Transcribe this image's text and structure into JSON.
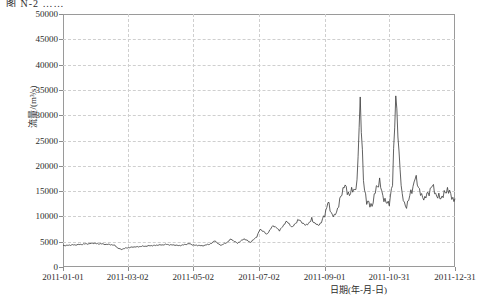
{
  "figure": {
    "caption": "图 N-2 ……",
    "axis_color": "#9a9a9a",
    "grid_color": "#cfcfcf",
    "line_color": "#3a3a3a"
  },
  "chart_data": {
    "type": "line",
    "title": "",
    "xlabel": "日期(年-月-日)",
    "ylabel": "流量/(m³/s)",
    "ylim": [
      0,
      50000
    ],
    "ytick_labels": [
      "0",
      "5000",
      "10000",
      "15000",
      "20000",
      "25000",
      "30000",
      "35000",
      "40000",
      "45000",
      "50000"
    ],
    "ytick_values": [
      0,
      5000,
      10000,
      15000,
      20000,
      25000,
      30000,
      35000,
      40000,
      45000,
      50000
    ],
    "xtick_labels": [
      "2011-01-01",
      "2011-03-02",
      "2011-05-02",
      "2011-07-02",
      "2011-09-01",
      "2011-10-31",
      "2011-12-31"
    ],
    "xtick_days": [
      0,
      60,
      121,
      182,
      243,
      303,
      364
    ],
    "xlim_days": [
      0,
      364
    ],
    "grid": true,
    "legend": null,
    "series": [
      {
        "name": "流量",
        "units": "m³/s",
        "x_days": [
          0,
          3,
          6,
          9,
          12,
          15,
          18,
          21,
          24,
          27,
          30,
          33,
          36,
          39,
          42,
          45,
          48,
          51,
          54,
          57,
          60,
          63,
          66,
          69,
          72,
          75,
          78,
          81,
          84,
          87,
          90,
          93,
          96,
          99,
          102,
          105,
          108,
          111,
          114,
          117,
          120,
          123,
          126,
          129,
          132,
          135,
          138,
          141,
          144,
          147,
          150,
          153,
          156,
          159,
          162,
          165,
          168,
          171,
          174,
          177,
          180,
          183,
          186,
          189,
          192,
          195,
          198,
          201,
          204,
          207,
          210,
          213,
          216,
          219,
          222,
          225,
          228,
          231,
          234,
          237,
          240,
          243,
          246,
          249,
          252,
          255,
          258,
          261,
          264,
          267,
          270,
          273,
          276,
          279,
          282,
          285,
          288,
          291,
          294,
          297,
          300,
          303,
          306,
          309,
          312,
          315,
          318,
          321,
          324,
          327,
          330,
          333,
          336,
          339,
          342,
          345,
          348,
          351,
          354,
          357,
          360,
          364
        ],
        "values": [
          4300,
          4250,
          4300,
          4400,
          4350,
          4450,
          4500,
          4550,
          4600,
          4700,
          4650,
          4600,
          4550,
          4500,
          4450,
          4400,
          4300,
          3700,
          3500,
          3650,
          3800,
          3900,
          3950,
          4000,
          4050,
          4100,
          4150,
          4200,
          4250,
          4300,
          4350,
          4400,
          4450,
          4400,
          4350,
          4300,
          4250,
          4300,
          4500,
          4600,
          4400,
          4300,
          4250,
          4200,
          4300,
          4450,
          4700,
          5200,
          4600,
          4300,
          4600,
          5000,
          5500,
          5100,
          4700,
          5100,
          5600,
          5200,
          4900,
          5400,
          6000,
          7500,
          7000,
          6500,
          7200,
          8200,
          7800,
          7200,
          8000,
          9000,
          8500,
          7900,
          8600,
          9400,
          8800,
          8200,
          8700,
          9200,
          8700,
          8200,
          8800,
          10500,
          12500,
          11000,
          9800,
          11500,
          14000,
          16000,
          15000,
          14500,
          15200,
          16500,
          33000,
          17000,
          13000,
          12000,
          13000,
          15500,
          17000,
          14000,
          12500,
          13000,
          16000,
          35000,
          22000,
          14000,
          12000,
          13000,
          15500,
          17500,
          16000,
          14000,
          13500,
          14500,
          16000,
          15000,
          14000,
          13500,
          14500,
          15500,
          14000,
          13500
        ],
        "major_peaks": [
          {
            "date": "2011-07-05",
            "value": 33000
          },
          {
            "date": "2011-07-20",
            "value": 35000
          },
          {
            "date": "2011-08-10",
            "value": 31000
          },
          {
            "date": "2011-08-21",
            "value": 35000
          },
          {
            "date": "2011-09-05",
            "value": 44000
          },
          {
            "date": "2011-10-25",
            "value": 17000
          }
        ],
        "baseline_low": 3500,
        "baseline_typical": 4500,
        "peak_max": 44000
      }
    ]
  }
}
